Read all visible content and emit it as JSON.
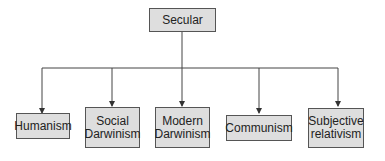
{
  "root": {
    "label": "Secular"
  },
  "children": [
    {
      "label": "Humanism"
    },
    {
      "label": "Social Darwinism",
      "lines": [
        "Social",
        "Darwinism"
      ]
    },
    {
      "label": "Modern Darwinism",
      "lines": [
        "Modern",
        "Darwinism"
      ]
    },
    {
      "label": "Communism"
    },
    {
      "label": "Subjective relativism",
      "lines": [
        "Subjective",
        "relativism"
      ]
    }
  ],
  "colors": {
    "box_fill": "#dedede",
    "box_border": "#555555",
    "line": "#444444"
  }
}
